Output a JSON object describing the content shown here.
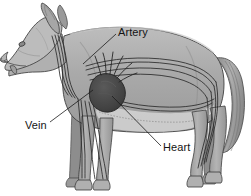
{
  "figure": {
    "view": "lateral side view, facing left",
    "style": "grayscale shaded line illustration",
    "background_color": "#ffffff",
    "width": 251,
    "height": 196
  },
  "labels": [
    {
      "id": "artery",
      "text": "Artery",
      "text_x": 118,
      "text_y": 26,
      "leader_from": [
        116,
        34
      ],
      "leader_to": [
        83,
        64
      ],
      "points_at": "arterial vessel along the shoulder and back"
    },
    {
      "id": "vein",
      "text": "Vein",
      "text_x": 25,
      "text_y": 119,
      "leader_from": [
        50,
        122
      ],
      "leader_to": [
        93,
        90
      ],
      "points_at": "venous vessel near the chest"
    },
    {
      "id": "heart",
      "text": "Heart",
      "text_x": 163,
      "text_y": 141,
      "leader_from": [
        161,
        146
      ],
      "leader_to": [
        112,
        96
      ],
      "points_at": "dark heart organ in the chest cavity"
    }
  ],
  "colors": {
    "body_fill": "#a9a9a9",
    "body_shadow": "#8f8f8f",
    "body_highlight": "#c2c2c2",
    "belly_fill": "#cfcfcf",
    "outline": "#3a3a3a",
    "vessel_line": "#2b2b2b",
    "heart_fill": "#4a4a4a",
    "heart_dark": "#3a3a3a",
    "label_text": "#141414",
    "leader_line": "#1a1a1a"
  },
  "anatomy_parts": [
    "head",
    "ear",
    "eye",
    "snout",
    "tongue",
    "neck",
    "back",
    "chest",
    "belly",
    "front-legs",
    "hind-legs",
    "tail",
    "paws"
  ]
}
